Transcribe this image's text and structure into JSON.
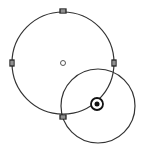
{
  "canvas": {
    "width": 142,
    "height": 147,
    "background": "#ffffff"
  },
  "colors": {
    "stroke": "#333333",
    "handle": "#222222"
  },
  "large_circle": {
    "cx": 63,
    "cy": 63,
    "r": 51,
    "handles": [
      {
        "name": "handle-top",
        "x": 63,
        "y": 11
      },
      {
        "name": "handle-left",
        "x": 12,
        "y": 63
      },
      {
        "name": "handle-right",
        "x": 114,
        "y": 63
      },
      {
        "name": "handle-bottom",
        "x": 63,
        "y": 117
      }
    ],
    "center_marker": {
      "x": 63,
      "y": 63,
      "r": 2.5
    }
  },
  "small_circle": {
    "cx": 98,
    "cy": 106,
    "r": 37
  },
  "target_point": {
    "x": 97,
    "y": 104,
    "outer_r": 6,
    "inner_r": 2.5
  }
}
